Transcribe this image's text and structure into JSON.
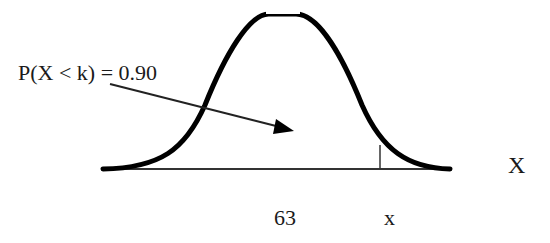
{
  "diagram": {
    "type": "normal-distribution-curve",
    "annotation": "P(X < k) = 0.90",
    "axis_label": "X",
    "tick_labels": {
      "mean": "63",
      "k": "x"
    },
    "colors": {
      "curve": "#000000",
      "background": "#ffffff"
    }
  }
}
